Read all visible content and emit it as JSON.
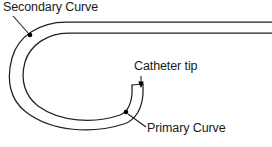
{
  "figure": {
    "type": "line-diagram",
    "background_color": "#ffffff",
    "stroke_color": "#231f20",
    "label_color": "#1a1a1a"
  },
  "labels": {
    "secondary_curve": "Secondary Curve",
    "catheter_tip": "Catheter tip",
    "primary_curve": "Primary Curve"
  },
  "caption": {
    "clipped_text": ""
  },
  "annotations": [
    {
      "name": "secondary-curve",
      "label": "Secondary Curve",
      "marker": "dot",
      "marker_x": 30,
      "marker_y": 35,
      "leader_from_x": 13,
      "leader_from_y": 16,
      "leader_to_x": 29,
      "leader_to_y": 34
    },
    {
      "name": "catheter-tip",
      "label": "Catheter tip",
      "marker": "arrow",
      "marker_x": 141,
      "marker_y": 86,
      "leader_from_x": 141,
      "leader_from_y": 76,
      "leader_to_x": 141,
      "leader_to_y": 86
    },
    {
      "name": "primary-curve",
      "label": "Primary Curve",
      "marker": "dot",
      "marker_x": 126,
      "marker_y": 112,
      "leader_from_x": 146,
      "leader_from_y": 127,
      "leader_to_x": 127,
      "leader_to_y": 113
    }
  ],
  "geometry": {
    "outer_wall_path": "M 272 22 L 66 22 C 40 22 18 36 12 58 C 6 80 10 100 26 112 C 52 132 92 134 124 124 C 136 120 142 108 143 94 L 143 84",
    "inner_wall_path": "M 272 33 L 68 33 C 48 33 30 45 25 62 C 20 80 25 96 38 106 C 60 122 94 124 120 115 C 128 112 131 104 132 94 L 132 85",
    "tip_cut_path": "M 143 84 L 132 85",
    "shaft_y_top": 22,
    "shaft_y_bottom": 33,
    "tube_width": 11
  }
}
